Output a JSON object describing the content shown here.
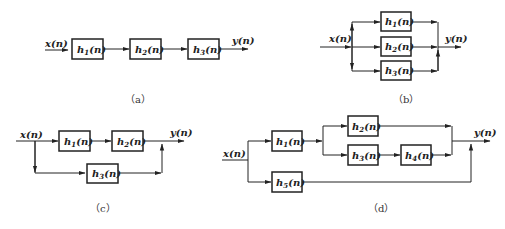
{
  "figure": {
    "panels": [
      {
        "id": "a",
        "caption": "（a）",
        "topology": "series",
        "input_label": "x(n)",
        "output_label": "y(n)",
        "blocks": [
          {
            "name": "h",
            "sub": "1",
            "rest": "(n)"
          },
          {
            "name": "h",
            "sub": "2",
            "rest": "(n)"
          },
          {
            "name": "h",
            "sub": "3",
            "rest": "(n)"
          }
        ]
      },
      {
        "id": "b",
        "caption": "（b）",
        "topology": "parallel",
        "input_label": "x(n)",
        "output_label": "y(n)",
        "blocks": [
          {
            "name": "h",
            "sub": "1",
            "rest": "(n)"
          },
          {
            "name": "h",
            "sub": "2",
            "rest": "(n)"
          },
          {
            "name": "h",
            "sub": "3",
            "rest": "(n)"
          }
        ]
      },
      {
        "id": "c",
        "caption": "（c）",
        "topology": "series-parallel",
        "input_label": "x(n)",
        "output_label": "y(n)",
        "blocks": [
          {
            "name": "h",
            "sub": "1",
            "rest": "(n)"
          },
          {
            "name": "h",
            "sub": "2",
            "rest": "(n)"
          },
          {
            "name": "h",
            "sub": "3",
            "rest": "(n)"
          }
        ]
      },
      {
        "id": "d",
        "caption": "（d）",
        "topology": "mixed",
        "input_label": "x(n)",
        "output_label": "y(n)",
        "blocks": [
          {
            "name": "h",
            "sub": "1",
            "rest": "(n)"
          },
          {
            "name": "h",
            "sub": "2",
            "rest": "(n)"
          },
          {
            "name": "h",
            "sub": "3",
            "rest": "(n)"
          },
          {
            "name": "h",
            "sub": "4",
            "rest": "(n)"
          },
          {
            "name": "h",
            "sub": "5",
            "rest": "(n)"
          }
        ]
      }
    ]
  }
}
